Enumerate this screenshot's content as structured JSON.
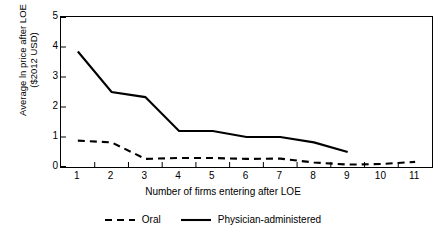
{
  "chart_data": {
    "type": "line",
    "title": "",
    "xlabel": "Number of firms entering after LOE",
    "ylabel_line1": "Average ln price after LOE",
    "ylabel_line2": "($2012 USD)",
    "x": [
      1,
      2,
      3,
      4,
      5,
      6,
      7,
      8,
      9,
      10,
      11
    ],
    "xtick_labels": [
      "1",
      "2",
      "3",
      "4",
      "5",
      "6",
      "7",
      "8",
      "9",
      "10",
      "11"
    ],
    "ytick_labels": [
      "0",
      "1",
      "2",
      "3",
      "4",
      "5"
    ],
    "ytick_values": [
      0,
      1,
      2,
      3,
      4,
      5
    ],
    "ylim": [
      0,
      5
    ],
    "xlim": [
      0.5,
      11.5
    ],
    "grid": false,
    "legend_position": "bottom",
    "series": [
      {
        "name": "Oral",
        "style": "dashed",
        "color": "#000000",
        "values": [
          0.88,
          0.82,
          0.27,
          0.3,
          0.3,
          0.27,
          0.28,
          0.15,
          0.08,
          0.1,
          0.17
        ]
      },
      {
        "name": "Physician-administered",
        "style": "solid",
        "color": "#000000",
        "values": [
          3.85,
          2.5,
          2.33,
          1.2,
          1.2,
          1.0,
          1.0,
          0.82,
          0.5,
          null,
          null
        ]
      }
    ]
  },
  "legend": {
    "items": [
      {
        "label": "Oral",
        "style": "dashed"
      },
      {
        "label": "Physician-administered",
        "style": "solid"
      }
    ]
  }
}
